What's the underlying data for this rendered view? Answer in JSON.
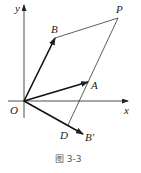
{
  "figure": {
    "caption": "图 3-3",
    "colors": {
      "stroke": "#222222",
      "caption": "#555555",
      "background": "#ffffff"
    }
  },
  "axes": {
    "x_label": "x",
    "y_label": "y",
    "origin_label": "O"
  },
  "points": {
    "O": {
      "label": "O",
      "x": 24,
      "y": 101
    },
    "A": {
      "label": "A",
      "x": 88,
      "y": 82
    },
    "B": {
      "label": "B",
      "x": 55,
      "y": 38
    },
    "P": {
      "label": "P",
      "x": 118,
      "y": 18
    },
    "D": {
      "label": "D",
      "x": 68,
      "y": 125
    },
    "Bp": {
      "label": "B'",
      "x": 83,
      "y": 134
    }
  },
  "vectors": [
    {
      "from": "O",
      "to": "B",
      "label": "OB"
    },
    {
      "from": "O",
      "to": "A",
      "label": "OA"
    },
    {
      "from": "O",
      "to": "Bp",
      "label": "OB'"
    }
  ],
  "segments": [
    {
      "from": "B",
      "to": "P"
    },
    {
      "from": "P",
      "to": "D"
    }
  ]
}
